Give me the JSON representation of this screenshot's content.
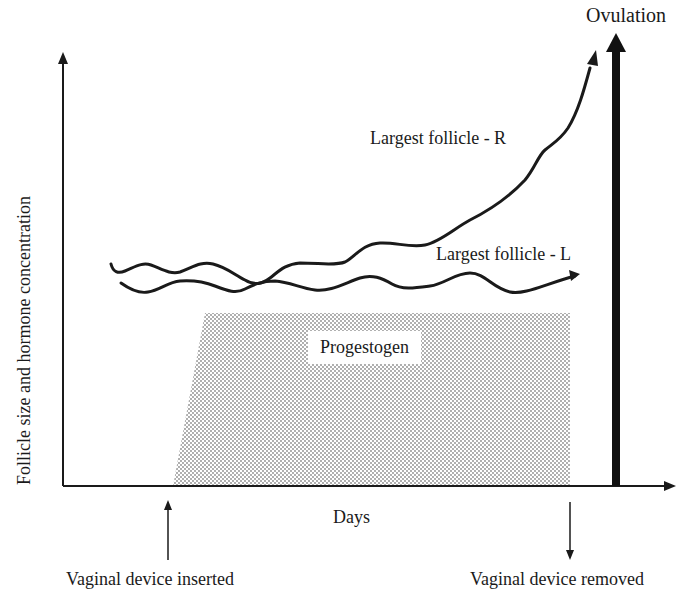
{
  "diagram": {
    "title": "Ovulation",
    "y_axis_label": "Follicle size and hormone concentration",
    "x_axis_label": "Days",
    "curves": [
      {
        "label": "Largest follicle - R",
        "trend": "flat then rising sharply toward ovulation"
      },
      {
        "label": "Largest follicle - L",
        "trend": "flat / wavy throughout"
      }
    ],
    "region": {
      "label": "Progestogen",
      "fill": "stippled grey"
    },
    "events": {
      "inserted": "Vaginal device inserted",
      "removed": "Vaginal device removed",
      "ovulation": "Ovulation"
    },
    "colors": {
      "line": "#1a1a1a",
      "stipple": "#8a8a8a",
      "background": "#ffffff"
    }
  }
}
